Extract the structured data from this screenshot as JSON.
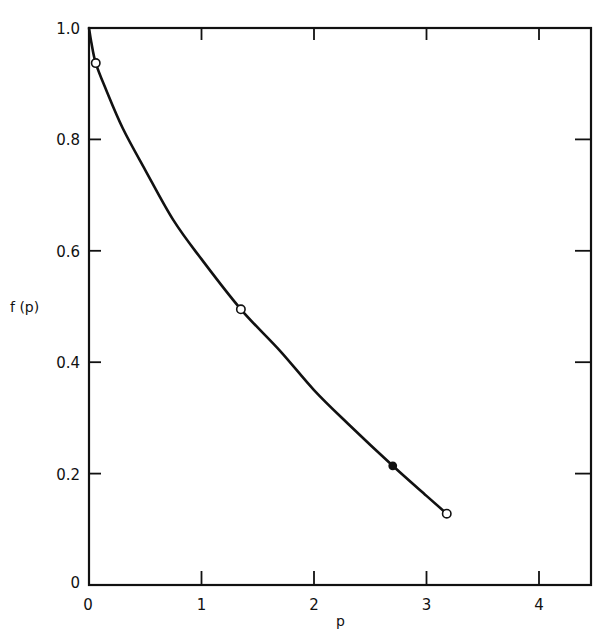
{
  "chart_data": {
    "type": "line",
    "title": "",
    "xlabel": "p",
    "ylabel": "f(p)",
    "xlim": [
      0,
      4.5
    ],
    "ylim": [
      0,
      1.0
    ],
    "x_ticks": [
      0,
      1,
      2,
      3,
      4
    ],
    "x_tick_labels": [
      "0",
      "1",
      "2",
      "3",
      "4"
    ],
    "y_ticks": [
      0,
      0.2,
      0.4,
      0.6,
      0.8,
      1.0
    ],
    "y_tick_labels": [
      "0",
      "0.2",
      "0.4",
      "0.6",
      "0.8",
      "1.0"
    ],
    "grid": false,
    "legend": null,
    "series": [
      {
        "name": "f(p) curve",
        "style": "solid",
        "x": [
          0.0,
          0.02,
          0.06,
          0.15,
          0.3,
          0.5,
          0.75,
          1.0,
          1.35,
          1.7,
          2.0,
          2.3,
          2.7,
          3.0,
          3.18
        ],
        "values": [
          1.0,
          0.975,
          0.937,
          0.89,
          0.82,
          0.745,
          0.655,
          0.585,
          0.495,
          0.42,
          0.35,
          0.29,
          0.214,
          0.16,
          0.128
        ]
      },
      {
        "name": "open points",
        "style": "marker-open-circle",
        "x": [
          0.06,
          1.35,
          3.18
        ],
        "values": [
          0.937,
          0.495,
          0.128
        ]
      },
      {
        "name": "filled point",
        "style": "marker-filled-circle",
        "x": [
          2.7
        ],
        "values": [
          0.214
        ]
      }
    ]
  },
  "labels": {
    "xlabel": "p",
    "ylabel": "f (p)",
    "x_ticks": [
      "0",
      "1",
      "2",
      "3",
      "4"
    ],
    "y_ticks": [
      "0",
      "0.2",
      "0.4",
      "0.6",
      "0.8",
      "1.0"
    ]
  },
  "colors": {
    "ink": "#111111",
    "background": "#ffffff"
  }
}
